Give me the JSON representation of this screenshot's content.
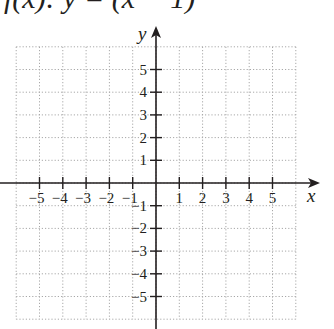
{
  "header": {
    "equation_partial": "f(x): y = (x − 1)"
  },
  "chart_data": {
    "type": "scatter",
    "title": "",
    "xlabel": "x",
    "ylabel": "y",
    "xlim": [
      -6,
      6
    ],
    "ylim": [
      -6,
      6
    ],
    "grid": true,
    "grid_style": "dotted",
    "x_ticks": [
      -5,
      -4,
      -3,
      -2,
      -1,
      1,
      2,
      3,
      4,
      5
    ],
    "y_ticks": [
      -5,
      -4,
      -3,
      -2,
      -1,
      1,
      2,
      3,
      4,
      5
    ],
    "x_tick_labels": [
      "−5",
      "−4",
      "−3",
      "−2",
      "−1",
      "1",
      "2",
      "3",
      "4",
      "5"
    ],
    "y_tick_labels": [
      "−5",
      "−4",
      "−3",
      "−2",
      "−1",
      "1",
      "2",
      "3",
      "4",
      "5"
    ],
    "series": []
  },
  "colors": {
    "axis": "#231f20",
    "grid": "#a8a8a8",
    "background": "#ffffff"
  }
}
